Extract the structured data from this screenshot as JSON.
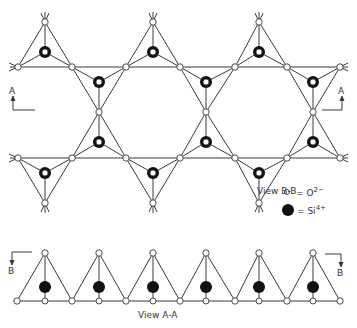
{
  "diagram": {
    "views": {
      "upper": {
        "label": "View B-B"
      },
      "lower": {
        "label": "View A-A"
      }
    },
    "section_markers": {
      "a_left": "A",
      "a_right": "A",
      "b_left": "B",
      "b_right": "B"
    },
    "legend": {
      "oxygen": {
        "symbol": "open-circle",
        "text": "= O",
        "charge": "2−"
      },
      "silicon": {
        "symbol": "filled-circle",
        "text": "= Si",
        "charge": "4+"
      }
    },
    "colors": {
      "line": "#3a3a3a",
      "oxygen_fill": "#ffffff",
      "silicon_fill": "#111111"
    }
  }
}
